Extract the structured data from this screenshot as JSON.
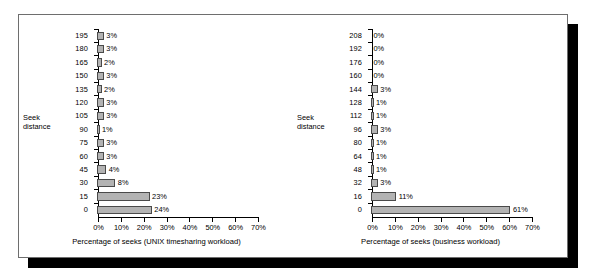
{
  "figure": {
    "panel_border_color": "#6e6e6e",
    "shadow_color": "#000000",
    "bar_fill_color": "#b3b3b3",
    "bar_border_color": "#4a4a4a",
    "axis_color": "#000000"
  },
  "charts": [
    {
      "id": "unix-timesharing",
      "axis_label_left_line1": "Seek",
      "axis_label_left_line2": "distance",
      "xlabel": "Percentage of seeks (UNIX timesharing workload)",
      "xticks": [
        "0%",
        "10%",
        "20%",
        "30%",
        "40%",
        "50%",
        "60%",
        "70%"
      ],
      "rows": [
        {
          "category": "195",
          "value_label": "3%",
          "value": 3
        },
        {
          "category": "180",
          "value_label": "3%",
          "value": 3
        },
        {
          "category": "165",
          "value_label": "2%",
          "value": 2
        },
        {
          "category": "150",
          "value_label": "3%",
          "value": 3
        },
        {
          "category": "135",
          "value_label": "2%",
          "value": 2
        },
        {
          "category": "120",
          "value_label": "3%",
          "value": 3
        },
        {
          "category": "105",
          "value_label": "3%",
          "value": 3
        },
        {
          "category": "90",
          "value_label": "1%",
          "value": 1
        },
        {
          "category": "75",
          "value_label": "3%",
          "value": 3
        },
        {
          "category": "60",
          "value_label": "3%",
          "value": 3
        },
        {
          "category": "45",
          "value_label": "4%",
          "value": 4
        },
        {
          "category": "30",
          "value_label": "8%",
          "value": 8
        },
        {
          "category": "15",
          "value_label": "23%",
          "value": 23
        },
        {
          "category": "0",
          "value_label": "24%",
          "value": 24
        }
      ]
    },
    {
      "id": "business-workload",
      "axis_label_left_line1": "Seek",
      "axis_label_left_line2": "distance",
      "xlabel": "Percentage of seeks (business workload)",
      "xticks": [
        "0%",
        "10%",
        "20%",
        "30%",
        "40%",
        "50%",
        "60%",
        "70%"
      ],
      "rows": [
        {
          "category": "208",
          "value_label": "0%",
          "value": 0
        },
        {
          "category": "192",
          "value_label": "0%",
          "value": 0
        },
        {
          "category": "176",
          "value_label": "0%",
          "value": 0
        },
        {
          "category": "160",
          "value_label": "0%",
          "value": 0
        },
        {
          "category": "144",
          "value_label": "3%",
          "value": 3
        },
        {
          "category": "128",
          "value_label": "1%",
          "value": 1
        },
        {
          "category": "112",
          "value_label": "1%",
          "value": 1
        },
        {
          "category": "96",
          "value_label": "3%",
          "value": 3
        },
        {
          "category": "80",
          "value_label": "1%",
          "value": 1
        },
        {
          "category": "64",
          "value_label": "1%",
          "value": 1
        },
        {
          "category": "48",
          "value_label": "1%",
          "value": 1
        },
        {
          "category": "32",
          "value_label": "3%",
          "value": 3
        },
        {
          "category": "16",
          "value_label": "11%",
          "value": 11
        },
        {
          "category": "0",
          "value_label": "61%",
          "value": 61
        }
      ]
    }
  ],
  "chart_data": [
    {
      "type": "bar",
      "orientation": "horizontal",
      "title": "",
      "xlabel": "Percentage of seeks (UNIX timesharing workload)",
      "ylabel": "Seek distance",
      "categories": [
        "0",
        "15",
        "30",
        "45",
        "60",
        "75",
        "90",
        "105",
        "120",
        "135",
        "150",
        "165",
        "180",
        "195"
      ],
      "values": [
        24,
        23,
        8,
        4,
        3,
        3,
        1,
        3,
        3,
        2,
        3,
        2,
        3,
        3
      ],
      "data_labels": [
        "24%",
        "23%",
        "8%",
        "4%",
        "3%",
        "3%",
        "1%",
        "3%",
        "3%",
        "2%",
        "3%",
        "2%",
        "3%",
        "3%"
      ],
      "xlim": [
        0,
        70
      ],
      "xticks": [
        0,
        10,
        20,
        30,
        40,
        50,
        60,
        70
      ],
      "xticklabels": [
        "0%",
        "10%",
        "20%",
        "30%",
        "40%",
        "50%",
        "60%",
        "70%"
      ],
      "grid": false,
      "legend": "none"
    },
    {
      "type": "bar",
      "orientation": "horizontal",
      "title": "",
      "xlabel": "Percentage of seeks (business workload)",
      "ylabel": "Seek distance",
      "categories": [
        "0",
        "16",
        "32",
        "48",
        "64",
        "80",
        "96",
        "112",
        "128",
        "144",
        "160",
        "176",
        "192",
        "208"
      ],
      "values": [
        61,
        11,
        3,
        1,
        1,
        1,
        3,
        1,
        1,
        3,
        0,
        0,
        0,
        0
      ],
      "data_labels": [
        "61%",
        "11%",
        "3%",
        "1%",
        "1%",
        "1%",
        "3%",
        "1%",
        "1%",
        "3%",
        "0%",
        "0%",
        "0%",
        "0%"
      ],
      "xlim": [
        0,
        70
      ],
      "xticks": [
        0,
        10,
        20,
        30,
        40,
        50,
        60,
        70
      ],
      "xticklabels": [
        "0%",
        "10%",
        "20%",
        "30%",
        "40%",
        "50%",
        "60%",
        "70%"
      ],
      "grid": false,
      "legend": "none"
    }
  ]
}
